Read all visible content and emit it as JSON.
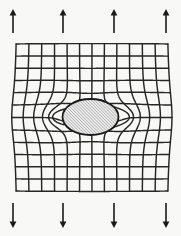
{
  "figure": {
    "width": 181,
    "height": 236,
    "background_color": "#f8f8f6"
  },
  "colors": {
    "mesh_stroke": "#262626",
    "arrow_stroke": "#1a1a1a",
    "inclusion_outline": "#1a1a1a",
    "inclusion_hatch": "#8c8c8c",
    "inclusion_fill": "#efefef"
  },
  "loading": {
    "top_label": "upward tension arrows",
    "bottom_label": "downward tension arrows",
    "arrow_count_top": 4,
    "arrow_count_bottom": 4,
    "top_arrows": [
      {
        "x": 13,
        "y_tail": 33,
        "y_tip": 9
      },
      {
        "x": 63,
        "y_tail": 33,
        "y_tip": 9
      },
      {
        "x": 114,
        "y_tail": 33,
        "y_tip": 9
      },
      {
        "x": 166,
        "y_tail": 33,
        "y_tip": 9
      }
    ],
    "bottom_arrows": [
      {
        "x": 13,
        "y_tail": 203,
        "y_tip": 228
      },
      {
        "x": 63,
        "y_tail": 203,
        "y_tip": 228
      },
      {
        "x": 114,
        "y_tail": 203,
        "y_tip": 228
      },
      {
        "x": 166,
        "y_tail": 203,
        "y_tip": 228
      }
    ]
  },
  "mesh": {
    "label": "deformed orthogonal coordinate mesh",
    "x_min": 16,
    "x_max": 168,
    "y_min": 44,
    "y_max": 191,
    "vertical_line_count": 13,
    "horizontal_line_count": 13,
    "nominal_spacing_x": 12.7,
    "nominal_spacing_y": 12.25
  },
  "inclusion": {
    "label": "elliptical inclusion",
    "shape": "ellipse",
    "center_x": 90.5,
    "center_y": 117,
    "radius_x": 28,
    "radius_y": 18,
    "hatch_angle_deg": 45,
    "hatch_spacing": 2.2
  },
  "chart_data": {
    "type": "diagram",
    "title": "Stress-field distortion of a square grid by an elliptical inclusion"
  }
}
